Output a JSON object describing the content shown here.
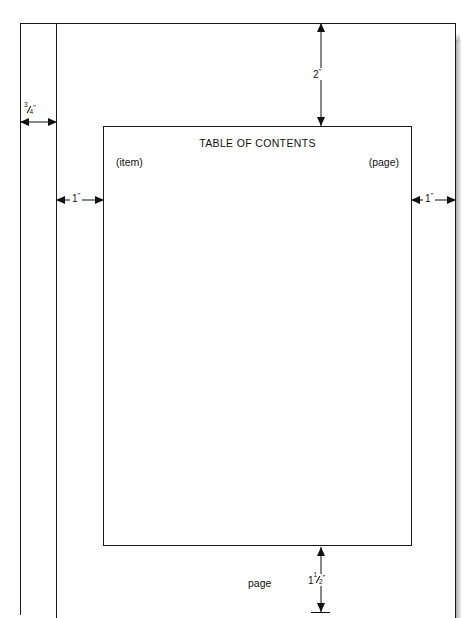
{
  "diagram": {
    "sheet": {
      "name": "page-sheet",
      "description": "Printed page outline with binding edge rule"
    },
    "type_block": {
      "heading": "TABLE OF CONTENTS",
      "item_column_label": "(item)",
      "page_column_label": "(page)"
    },
    "dimensions": [
      {
        "id": "binding-margin",
        "label_whole": "",
        "label_numerator": "3",
        "label_denominator": "4",
        "label_inch_mark": "\"",
        "label_text": "3/4\"",
        "orientation": "horizontal",
        "meaning": "binding edge allowance"
      },
      {
        "id": "left-margin",
        "label_whole": "1",
        "label_numerator": "",
        "label_denominator": "",
        "label_inch_mark": "\"",
        "label_text": "1\"",
        "orientation": "horizontal",
        "meaning": "left margin"
      },
      {
        "id": "right-margin",
        "label_whole": "1",
        "label_numerator": "",
        "label_denominator": "",
        "label_inch_mark": "\"",
        "label_text": "1\"",
        "orientation": "horizontal",
        "meaning": "right margin"
      },
      {
        "id": "top-margin",
        "label_whole": "2",
        "label_numerator": "",
        "label_denominator": "",
        "label_inch_mark": "\"",
        "label_text": "2\"",
        "orientation": "vertical",
        "meaning": "top margin"
      },
      {
        "id": "bottom-margin",
        "label_whole": "1",
        "label_numerator": "1",
        "label_denominator": "2",
        "label_inch_mark": "\"",
        "label_text": "1 1/2\"",
        "orientation": "vertical",
        "meaning": "bottom margin"
      }
    ],
    "footer": {
      "page_number_caption": "page"
    },
    "colors": {
      "line": "#1a1a1a",
      "text": "#111111",
      "background": "#ffffff",
      "shadow": "#9e9e9e"
    }
  }
}
